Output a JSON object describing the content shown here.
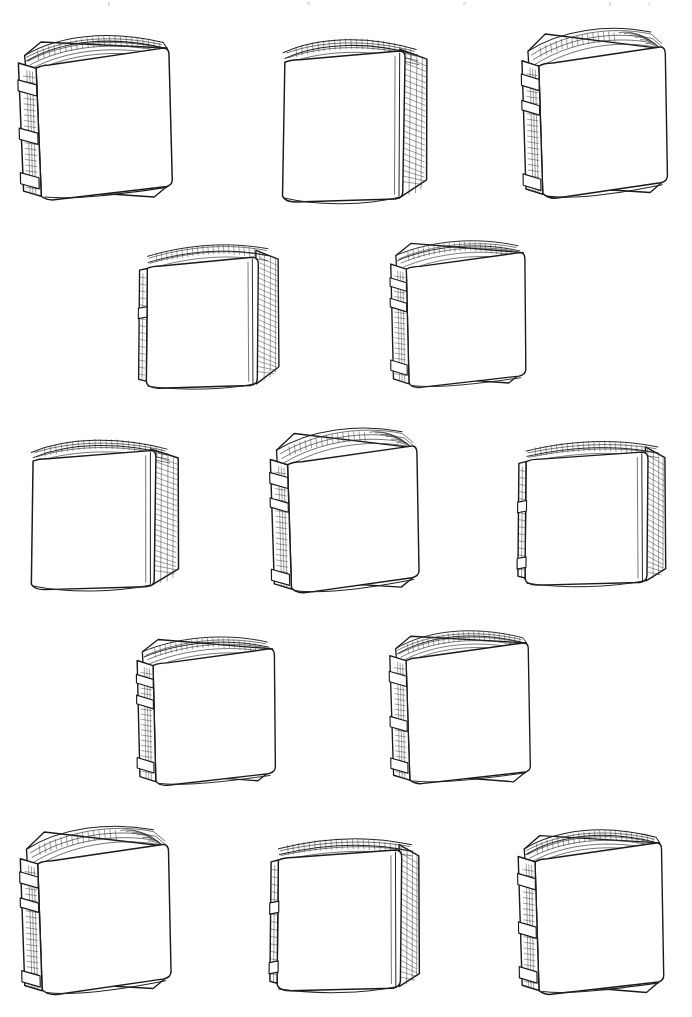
{
  "document": {
    "title": "Hand-Drawn Blank Books Illustration Sheet",
    "medium": "pen-and-ink line drawing",
    "background_color": "#ffffff",
    "ink_color": "#1a1a1a",
    "canvas": {
      "width": 692,
      "height": 1017
    },
    "subject": "blank standing hardcover books",
    "book_count": 13,
    "row_count": 5,
    "caption": ""
  },
  "artwork": {
    "rows": [
      {
        "index": 1,
        "book_indices": [
          0,
          1,
          2
        ],
        "label": "row-1"
      },
      {
        "index": 2,
        "book_indices": [
          3,
          4
        ],
        "label": "row-2"
      },
      {
        "index": 3,
        "book_indices": [
          5,
          6,
          7
        ],
        "label": "row-3"
      },
      {
        "index": 4,
        "book_indices": [
          8,
          9
        ],
        "label": "row-4"
      },
      {
        "index": 5,
        "book_indices": [
          10,
          11,
          12
        ],
        "label": "row-5"
      }
    ],
    "books": [
      {
        "id": "book-1",
        "label": "Book 1",
        "row": 1,
        "column": 1,
        "pose": "three-quarter-right",
        "spine_side": "left",
        "spine_bands": 3,
        "x": 6,
        "y": 22,
        "w": 185,
        "h": 195,
        "rotate": -1.5
      },
      {
        "id": "book-2",
        "label": "Book 2",
        "row": 1,
        "column": 2,
        "pose": "three-quarter-left-open",
        "spine_side": "right",
        "spine_bands": 0,
        "x": 262,
        "y": 22,
        "w": 182,
        "h": 198,
        "rotate": 1.0
      },
      {
        "id": "book-3",
        "label": "Book 3",
        "row": 1,
        "column": 3,
        "pose": "three-quarter-right-fanned",
        "spine_side": "left",
        "spine_bands": 3,
        "x": 508,
        "y": 18,
        "w": 176,
        "h": 198,
        "rotate": -1.0
      },
      {
        "id": "book-4",
        "label": "Book 4",
        "row": 2,
        "column": 1,
        "pose": "near-frontal-left-open",
        "spine_side": "right",
        "spine_bands": 0,
        "x": 128,
        "y": 224,
        "w": 172,
        "h": 182,
        "rotate": 0.5
      },
      {
        "id": "book-5",
        "label": "Book 5",
        "row": 2,
        "column": 2,
        "pose": "three-quarter-right",
        "spine_side": "left",
        "spine_bands": 3,
        "x": 374,
        "y": 224,
        "w": 172,
        "h": 180,
        "rotate": -0.5
      },
      {
        "id": "book-6",
        "label": "Book 6",
        "row": 3,
        "column": 1,
        "pose": "three-quarter-left-open",
        "spine_side": "right",
        "spine_bands": 0,
        "x": 10,
        "y": 424,
        "w": 186,
        "h": 182,
        "rotate": 0.8
      },
      {
        "id": "book-7",
        "label": "Book 7",
        "row": 3,
        "column": 2,
        "pose": "three-quarter-right-fanned",
        "spine_side": "left",
        "spine_bands": 3,
        "x": 256,
        "y": 418,
        "w": 180,
        "h": 192,
        "rotate": -1.0
      },
      {
        "id": "book-8",
        "label": "Book 8",
        "row": 3,
        "column": 3,
        "pose": "near-frontal-right-open",
        "spine_side": "left",
        "spine_bands": 2,
        "x": 506,
        "y": 420,
        "w": 178,
        "h": 185,
        "rotate": 0.5
      },
      {
        "id": "book-9",
        "label": "Book 9",
        "row": 4,
        "column": 1,
        "pose": "near-frontal-right",
        "spine_side": "left",
        "spine_bands": 3,
        "x": 120,
        "y": 620,
        "w": 176,
        "h": 182,
        "rotate": -0.5
      },
      {
        "id": "book-10",
        "label": "Book 10",
        "row": 4,
        "column": 2,
        "pose": "three-quarter-right",
        "spine_side": "left",
        "spine_bands": 3,
        "x": 378,
        "y": 618,
        "w": 170,
        "h": 182,
        "rotate": -1.0
      },
      {
        "id": "book-11",
        "label": "Book 11",
        "row": 5,
        "column": 1,
        "pose": "three-quarter-right-fanned",
        "spine_side": "left",
        "spine_bands": 3,
        "x": 6,
        "y": 816,
        "w": 182,
        "h": 196,
        "rotate": -1.2
      },
      {
        "id": "book-12",
        "label": "Book 12",
        "row": 5,
        "column": 2,
        "pose": "near-frontal-left-open",
        "spine_side": "right",
        "spine_bands": 0,
        "x": 258,
        "y": 816,
        "w": 180,
        "h": 196,
        "rotate": 0.6
      },
      {
        "id": "book-13",
        "label": "Book 13",
        "row": 5,
        "column": 3,
        "pose": "three-quarter-right",
        "spine_side": "left",
        "spine_bands": 3,
        "x": 506,
        "y": 816,
        "w": 176,
        "h": 196,
        "rotate": -1.0
      }
    ]
  }
}
